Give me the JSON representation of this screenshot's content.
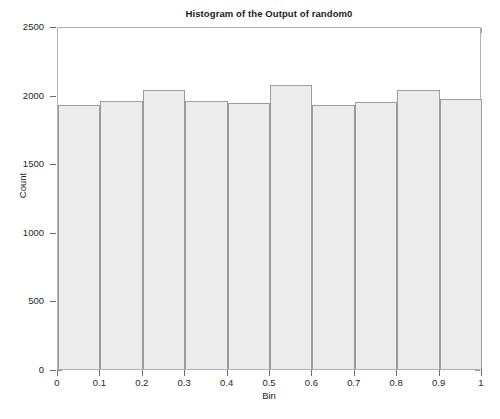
{
  "chart_data": {
    "type": "bar",
    "title": "Histogram of the Output of random0",
    "xlabel": "Bin",
    "ylabel": "Count",
    "xlim": [
      0,
      1
    ],
    "ylim": [
      0,
      2500
    ],
    "grid": false,
    "legend": null,
    "xticks": [
      "0",
      "0.1",
      "0.2",
      "0.3",
      "0.4",
      "0.5",
      "0.6",
      "0.7",
      "0.8",
      "0.9",
      "1"
    ],
    "xtick_values": [
      0,
      0.1,
      0.2,
      0.3,
      0.4,
      0.5,
      0.6,
      0.7,
      0.8,
      0.9,
      1
    ],
    "yticks": [
      "0",
      "500",
      "1000",
      "1500",
      "2000",
      "2500"
    ],
    "ytick_values": [
      0,
      500,
      1000,
      1500,
      2000,
      2500
    ],
    "bin_edges": [
      0,
      0.1,
      0.2,
      0.3,
      0.4,
      0.5,
      0.6,
      0.7,
      0.8,
      0.9,
      1
    ],
    "categories": [
      "0-0.1",
      "0.1-0.2",
      "0.2-0.3",
      "0.3-0.4",
      "0.4-0.5",
      "0.5-0.6",
      "0.6-0.7",
      "0.7-0.8",
      "0.8-0.9",
      "0.9-1"
    ],
    "values": [
      1925,
      1955,
      2035,
      1955,
      1940,
      2070,
      1925,
      1945,
      2030,
      1970
    ],
    "bar_fill_color": "#ececed",
    "bar_edge_color": "#9b9b9b",
    "axis_color": "#b0b0b0",
    "text_color": "#1a1a1a",
    "background_color": "#ffffff"
  }
}
